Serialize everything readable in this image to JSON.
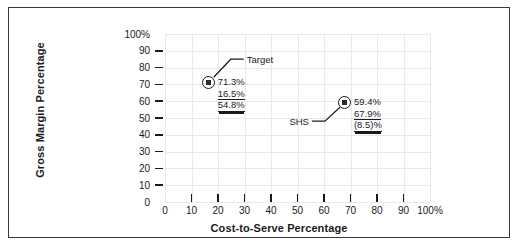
{
  "chart_data": {
    "type": "scatter",
    "title": "",
    "xlabel": "Cost-to-Serve Percentage",
    "ylabel": "Gross Margin Percentage",
    "xlim": [
      0,
      100
    ],
    "ylim": [
      0,
      100
    ],
    "grid": true,
    "legend": "none",
    "x_ticks": [
      "0",
      "10",
      "20",
      "30",
      "40",
      "50",
      "60",
      "70",
      "80",
      "90",
      "100%"
    ],
    "x_tick_values": [
      0,
      10,
      20,
      30,
      40,
      50,
      60,
      70,
      80,
      90,
      100
    ],
    "y_ticks": [
      "0",
      "10",
      "20",
      "30",
      "40",
      "50",
      "60",
      "70",
      "80",
      "90",
      "100%"
    ],
    "y_tick_values": [
      0,
      10,
      20,
      30,
      40,
      50,
      60,
      70,
      80,
      90,
      100
    ],
    "points": [
      {
        "name": "Target",
        "label": "Target",
        "x": 16.5,
        "y": 71.3,
        "annotations": [
          {
            "text": "71.3%",
            "style": "plain"
          },
          {
            "text": "16.5%",
            "style": "underline"
          },
          {
            "text": "54.8%",
            "style": "double-underline"
          }
        ]
      },
      {
        "name": "SHS",
        "label": "SHS",
        "x": 67.9,
        "y": 59.4,
        "annotations": [
          {
            "text": "59.4%",
            "style": "plain"
          },
          {
            "text": "67.9%",
            "style": "underline"
          },
          {
            "text": "(8.5)%",
            "style": "double-underline"
          }
        ]
      }
    ],
    "colors": {
      "marker": "#1a1a1a",
      "grid": "#e9e9ec",
      "text": "#1a1a1a",
      "frame": "#3a3a3a",
      "background": "#ffffff"
    }
  }
}
